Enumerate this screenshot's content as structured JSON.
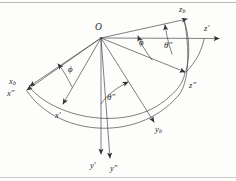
{
  "figure": {
    "origin_label": "O",
    "stroke_color": "#3a3a3a",
    "background_color": "#fdfdfc",
    "axis_labels": [
      {
        "id": "z-b",
        "text": "z",
        "sub": "b",
        "x": 179,
        "y": 8
      },
      {
        "id": "z-prime",
        "text": "z′",
        "sub": "",
        "x": 205,
        "y": 27
      },
      {
        "id": "z-dprime",
        "text": "z″",
        "sub": "",
        "x": 190,
        "y": 84
      },
      {
        "id": "x-b",
        "text": "x",
        "sub": "b",
        "x": 9,
        "y": 80
      },
      {
        "id": "x-dprime",
        "text": "x″",
        "sub": "",
        "x": 7,
        "y": 92
      },
      {
        "id": "x-prime",
        "text": "x′",
        "sub": "",
        "x": 55,
        "y": 114
      },
      {
        "id": "y-b",
        "text": "y",
        "sub": "b",
        "x": 155,
        "y": 128
      },
      {
        "id": "y-prime",
        "text": "y′",
        "sub": "",
        "x": 90,
        "y": 164
      },
      {
        "id": "y-dprime",
        "text": "y″",
        "sub": "",
        "x": 110,
        "y": 167
      }
    ],
    "angle_labels": [
      {
        "id": "phi-upper",
        "text": "ϕ",
        "x": 139,
        "y": 42
      },
      {
        "id": "theta-upper",
        "text": "θ″",
        "x": 164,
        "y": 45
      },
      {
        "id": "phi-left",
        "text": "ϕ",
        "x": 68,
        "y": 68
      },
      {
        "id": "theta-lower",
        "text": "θ″",
        "x": 107,
        "y": 96
      }
    ],
    "origin": {
      "x": 97,
      "y": 27,
      "px": 101,
      "py": 38
    }
  }
}
